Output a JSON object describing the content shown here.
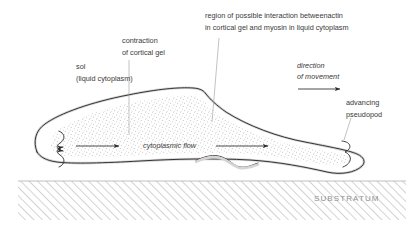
{
  "diagram": {
    "title_labels": {
      "region": {
        "line1": "region of possible interaction betweenactin",
        "line2": "in cortical gel and myosin in liquid cytoplasm"
      },
      "contraction": {
        "line1": "contraction",
        "line2": "of cortical gel"
      },
      "sol": {
        "line1": "sol",
        "line2": "(liquid cytoplasm)"
      },
      "direction": {
        "line1": "direction",
        "line2": "of movement"
      },
      "pseudopod": {
        "line1": "advancing",
        "line2": "pseudopod"
      },
      "flow": "cytoplasmic flow",
      "substratum": "SUBSTRATUM"
    },
    "colors": {
      "text": "#3a3a3a",
      "muted_text": "#8f8f8f",
      "outline": "#2b2b2b",
      "cortex": "#d5d5d5",
      "leader": "#9a9a9a",
      "hatch": "#b9b9b9",
      "stipple": "#9b9b9b",
      "background": "#ffffff"
    },
    "icons": {
      "flow_arrow_left": "arrow-right-icon",
      "flow_arrow_right": "arrow-right-icon",
      "direction_arrow": "arrow-right-icon",
      "cortical_squiggle_upper": "wavy-arrow-icon",
      "cortical_squiggle_lower": "wavy-arrow-icon",
      "pseudopod_squiggle": "wavy-line-icon"
    }
  }
}
